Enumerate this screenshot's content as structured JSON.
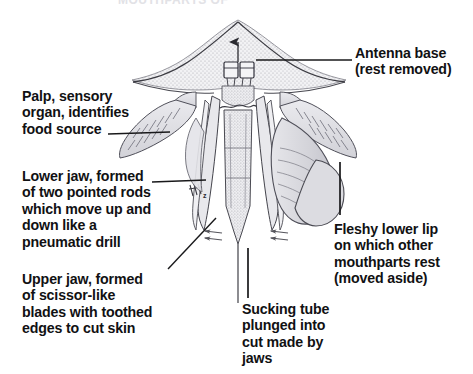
{
  "figure": {
    "title_fragment": "MOUTHPARTS OF",
    "background_color": "#ffffff",
    "ink_color": "#111113",
    "stipple_color": "#c9c9cf",
    "shading_color": "#d7d7db"
  },
  "labels": {
    "antenna_base": "Antenna base\n(rest removed)",
    "palp": "Palp, sensory\norgan, identifies\nfood source",
    "lower_jaw": "Lower jaw, formed\nof two pointed rods\nwhich move up and\ndown like a\npneumatic drill",
    "upper_jaw": "Upper jaw, formed\nof scissor-like\nblades with toothed\nedges to cut skin",
    "fleshy_lower_lip": "Fleshy lower lip\non which other\nmouthparts rest\n(moved aside)",
    "sucking_tube": "Sucking tube\nplunged into\ncut made by\njaws"
  },
  "annotations": {
    "motion_arrow_left": "left-pointing double arrow",
    "motion_arrow_right": "left-pointing double arrow",
    "antenna_arrow": "up arrow at antenna midline",
    "rod_marker": "small hatched rod marker",
    "rod_marker_letter": "z"
  },
  "leaders": {
    "antenna_base": "horizontal line from label left edge to antenna base",
    "palp": "horizontal line from label to left palp",
    "lower_jaw": "horizontal line from label to lower jaw rods",
    "upper_jaw": "diagonal line from label up-right to upper jaw blade tip",
    "fleshy_lower_lip": "vertical line from label up to lower lip lobe",
    "sucking_tube": "vertical line from label up to sucking tube tip"
  }
}
